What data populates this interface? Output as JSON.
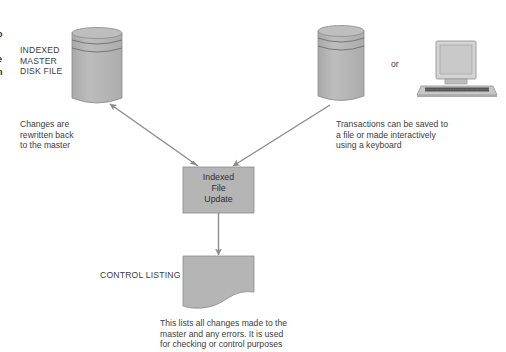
{
  "diagram": {
    "edge_fragment": {
      "lines": [
        "o",
        "t",
        "e",
        "n",
        "-"
      ]
    },
    "master_file": {
      "shape": "cylinder",
      "label_lines": [
        "INDEXED",
        "MASTER",
        "DISK FILE"
      ]
    },
    "master_note": {
      "lines": [
        "Changes are",
        "rewritten back",
        "to the master"
      ]
    },
    "transaction_file": {
      "shape": "cylinder"
    },
    "or_label": "or",
    "terminal": {
      "shape": "computer-terminal"
    },
    "transaction_note": {
      "lines": [
        "Transactions can be saved to",
        "a file or made interactively",
        "using a keyboard"
      ]
    },
    "process": {
      "shape": "rectangle",
      "label_lines": [
        "Indexed",
        "File",
        "Update"
      ]
    },
    "report": {
      "shape": "document",
      "label": "CONTROL LISTING"
    },
    "report_note": {
      "lines": [
        "This lists all changes made to the",
        "master and any errors. It is used",
        "for checking or control purposes"
      ]
    },
    "connections": [
      {
        "from": "process",
        "to": "master_file",
        "direction": "bidirectional"
      },
      {
        "from": "transaction_file",
        "to": "process",
        "direction": "forward"
      },
      {
        "from": "process",
        "to": "report",
        "direction": "forward"
      }
    ],
    "colors": {
      "shape_fill": "#b5b5b5",
      "shape_stroke": "#8a8a8a",
      "arrow": "#8c8c8c",
      "text": "#3d3d3d"
    }
  }
}
